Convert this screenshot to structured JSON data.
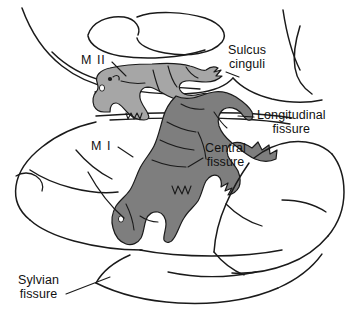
{
  "figure": {
    "background_color": "#ffffff",
    "outline_color": "#1a1a1a"
  },
  "regions": {
    "m1": {
      "label": "M I",
      "name": "primary-motor-cortex",
      "fill_color": "#7e7e7e",
      "description": "Primary motor cortex homunculus, dark gray shading on the lateral convexity"
    },
    "m2": {
      "label": "M II",
      "name": "supplementary-motor-area",
      "fill_color": "#a6a6a6",
      "description": "Supplementary motor area homunculus, light gray shading on the medial surface"
    }
  },
  "labels": {
    "sulcus_cinguli": "Sulcus\ncinguli",
    "longitudinal_fissure": "Longitudinal\nfissure",
    "central_fissure": "Central\nfissure",
    "sylvian_fissure": "Sylvian\nfissure",
    "m2": "M II",
    "m1": "M I"
  }
}
